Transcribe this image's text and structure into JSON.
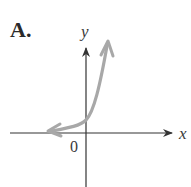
{
  "figure": {
    "option_label": "A.",
    "x_axis_label": "x",
    "y_axis_label": "y",
    "origin_label": "0",
    "curve_color": "#a8a8a8",
    "axis_color": "#333333",
    "curve_description": "Exponential growth curve, asymptotic to negative x-axis, positive y-intercept, arrows on both ends"
  }
}
